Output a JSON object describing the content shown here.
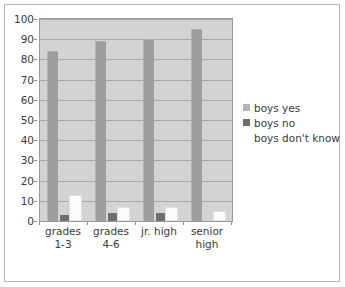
{
  "chart_data": {
    "type": "bar",
    "title": "",
    "subtitle": "",
    "xlabel": "",
    "ylabel": "",
    "ylim": [
      0,
      100
    ],
    "yticks": [
      0,
      10,
      20,
      30,
      40,
      50,
      60,
      70,
      80,
      90,
      100
    ],
    "ytick_labels": [
      "0",
      "10",
      "20",
      "30",
      "40",
      "50",
      "60",
      "70",
      "80",
      "90",
      "100"
    ],
    "grid": true,
    "legend_position": "right",
    "categories": [
      "grades 1-3",
      "grades 4-6",
      "jr. high",
      "senior high"
    ],
    "category_lines": [
      [
        "grades",
        "1-3"
      ],
      [
        "grades",
        "4-6"
      ],
      [
        "jr. high",
        ""
      ],
      [
        "senior",
        "high"
      ]
    ],
    "series": [
      {
        "name": "boys yes",
        "color": "#9e9e9e",
        "values": [
          84,
          89,
          90,
          95
        ]
      },
      {
        "name": "boys no",
        "color": "#6e6e6e",
        "values": [
          3,
          4,
          4,
          0
        ]
      },
      {
        "name": "boys don't know",
        "color": "#ffffff",
        "values": [
          13,
          7,
          7,
          5
        ]
      }
    ]
  },
  "legend": {
    "entries": [
      {
        "label": "boys yes",
        "swatch": "light-gray-swatch"
      },
      {
        "label": "boys no",
        "swatch": "dark-gray-swatch"
      },
      {
        "label": "boys don't know",
        "swatch": "white-swatch"
      }
    ]
  },
  "colors": {
    "plot_background": "#d3d3d3",
    "figure_background": "#ffffff",
    "gridline": "#a8a8a8",
    "frame_border": "#b9b9b9",
    "axis_text": "#3a3a3a",
    "series_yes": "#9e9e9e",
    "series_no": "#6e6e6e",
    "series_dont_know": "#ffffff"
  }
}
